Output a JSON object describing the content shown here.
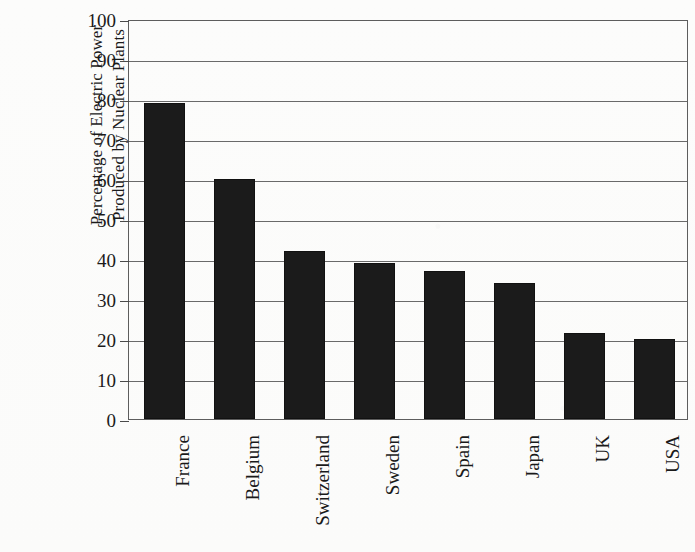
{
  "chart_data": {
    "type": "bar",
    "title": "",
    "xlabel": "",
    "ylabel": "Percentage of Electric Power Produced by Nuclear Plants",
    "ylabel_lines": [
      "Percentage of Electric Power",
      "Produced by Nuclear Plants"
    ],
    "categories": [
      "France",
      "Belgium",
      "Switzerland",
      "Sweden",
      "Spain",
      "Japan",
      "UK",
      "USA"
    ],
    "values": [
      79,
      60,
      42,
      39,
      37,
      34,
      21.5,
      20
    ],
    "ylim": [
      0,
      100
    ],
    "ytick_labels": [
      "0",
      "10",
      "20",
      "30",
      "40",
      "50",
      "60",
      "70",
      "80",
      "90",
      "100"
    ],
    "ytick_values": [
      0,
      10,
      20,
      30,
      40,
      50,
      60,
      70,
      80,
      90,
      100
    ],
    "grid": true,
    "legend": "none",
    "bar_color": "#1b1b1b",
    "axis_color": "#5d5d5d",
    "background_color": "#fdfdfc"
  }
}
